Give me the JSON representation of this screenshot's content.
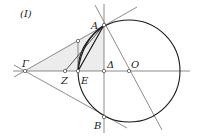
{
  "figure": {
    "label": "(I)",
    "points": {
      "A": {
        "label": "A",
        "x": 104,
        "y": 25
      },
      "B": {
        "label": "B",
        "x": 104,
        "y": 117
      },
      "Gamma": {
        "label": "Γ",
        "x": 25,
        "y": 71
      },
      "Z": {
        "label": "Z",
        "x": 65,
        "y": 71
      },
      "E": {
        "label": "E",
        "x": 78,
        "y": 71
      },
      "Delta": {
        "label": "Δ",
        "x": 104,
        "y": 71
      },
      "O": {
        "label": "O",
        "x": 129,
        "y": 71
      }
    },
    "circle": {
      "center": "O",
      "cx": 129,
      "cy": 71,
      "r": 51
    },
    "colors": {
      "line": "#6e6e6e",
      "circle": "#1a1a1a",
      "shade": "#ececec",
      "text": "#222222"
    }
  }
}
